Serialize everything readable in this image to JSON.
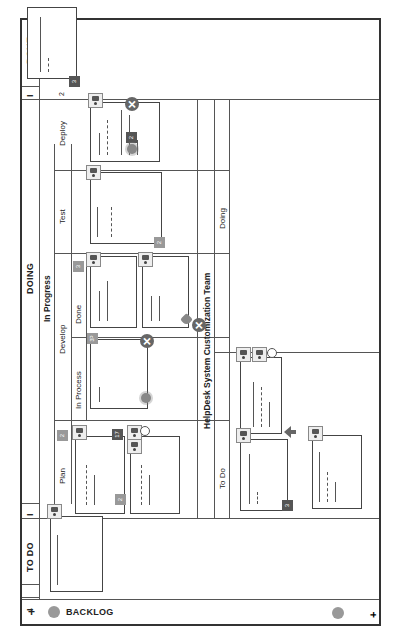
{
  "board": {
    "add_button": "+",
    "backlog_label": "BACKLOG",
    "backlog_icon": "person-circle-icon",
    "columns": {
      "todo": {
        "title": "TO DO",
        "collapse_left": "I",
        "collapse_right": "I"
      },
      "doing": {
        "title": "DOING",
        "collapse": "I",
        "group": "In Progress",
        "sub_columns": {
          "plan": {
            "title": "Plan",
            "wip": "2"
          },
          "develop": {
            "title": "Develop",
            "in_process": {
              "title": "In Process",
              "wip": "3P"
            },
            "done": {
              "title": "Done",
              "wip": "3"
            }
          },
          "test": {
            "title": "Test"
          },
          "deploy": {
            "title": "Deploy",
            "wip": "2"
          }
        }
      },
      "done": {
        "title": "DONE",
        "collapse": "I"
      }
    },
    "swimlane": {
      "title": "HelpDesk System Customization Team",
      "columns": {
        "todo": "To Do",
        "doing": "Doing"
      }
    },
    "card_badges": {
      "done_card": "3",
      "deploy_card": "2",
      "test_card": "2",
      "plan_card": "17",
      "plan_card_doc": "2",
      "swim_todo_card": "3"
    },
    "icons": {
      "close": "✕"
    }
  }
}
